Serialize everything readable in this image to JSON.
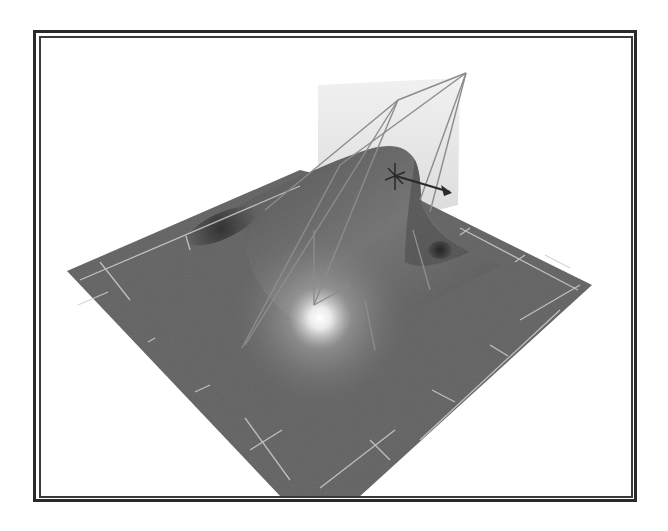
{
  "figure": {
    "colors": {
      "background": "#ffffff",
      "frame": "#2a2a2a",
      "surface": "#6b6b6b",
      "surface_dark": "#3c3c3c",
      "surface_light": "#9a9a9a",
      "highlight": "#ffffff",
      "grid_lines": "#c8c8c8",
      "lattice_lines": "#8a8a8a",
      "translucent_plane": "#d9d9d9",
      "manipulator": "#2a2a2a"
    },
    "icons": {
      "manipulator": "move-manipulator-icon",
      "arrow": "arrow-right-icon"
    }
  }
}
